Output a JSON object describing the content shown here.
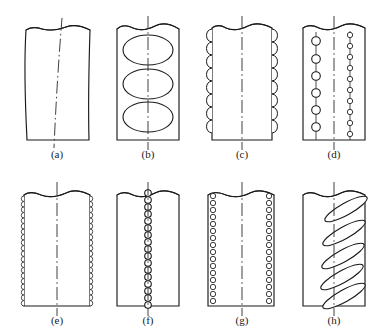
{
  "figure": {
    "type": "technical-line-drawing",
    "panel_count": 8,
    "rows": 2,
    "columns": 4,
    "background_color": "#ffffff",
    "line_color": "#1a1a1a",
    "caption_color": "#1a1a1a"
  },
  "panels": [
    {
      "id": "a",
      "label": "(a)",
      "row": 0,
      "column": 0,
      "box": {
        "x": 24,
        "y": 22,
        "width": 66,
        "height": 118
      },
      "feature_type": "none",
      "feature_count": 0,
      "outline_style": "skewed-curved",
      "centerline": "curved-dash-dot",
      "break_line_top": true,
      "caption_x": 57,
      "caption_y": 158
    },
    {
      "id": "b",
      "label": "(b)",
      "row": 0,
      "column": 1,
      "box": {
        "x": 117,
        "y": 22,
        "width": 62,
        "height": 118
      },
      "feature_type": "large-horizontal-ellipses",
      "feature_count": 3,
      "feature_rx": 24,
      "feature_ry": 15,
      "outline_style": "straight",
      "centerline": "straight-dash-dot",
      "break_line_top": true,
      "caption_x": 148,
      "caption_y": 158
    },
    {
      "id": "c",
      "label": "(c)",
      "row": 0,
      "column": 2,
      "box": {
        "x": 212,
        "y": 22,
        "width": 60,
        "height": 118
      },
      "feature_type": "edge-scallops-coarse",
      "feature_count": 9,
      "scallop_radius": 6.5,
      "outline_style": "straight",
      "centerline": "straight-dash-dot",
      "break_line_top": true,
      "caption_x": 242,
      "caption_y": 158
    },
    {
      "id": "d",
      "label": "(d)",
      "row": 0,
      "column": 3,
      "box": {
        "x": 303,
        "y": 22,
        "width": 62,
        "height": 118
      },
      "feature_type": "two-columns-of-circles",
      "left_column_count": 6,
      "left_column_radius": 4.2,
      "right_column_count": 10,
      "right_column_radius": 2.6,
      "outline_style": "straight",
      "centerline": "straight-dash-dot",
      "break_line_top": true,
      "caption_x": 334,
      "caption_y": 158
    },
    {
      "id": "e",
      "label": "(e)",
      "row": 1,
      "column": 0,
      "box": {
        "x": 24,
        "y": 188,
        "width": 66,
        "height": 118
      },
      "feature_type": "edge-scallops-fine",
      "feature_count": 21,
      "scallop_radius": 2.7,
      "outline_style": "straight",
      "centerline": "straight-dash-dot",
      "break_line_top": true,
      "caption_x": 57,
      "caption_y": 324
    },
    {
      "id": "f",
      "label": "(f)",
      "row": 1,
      "column": 1,
      "box": {
        "x": 117,
        "y": 188,
        "width": 62,
        "height": 118
      },
      "feature_type": "center-column-of-circles",
      "feature_count": 19,
      "feature_radius": 3.2,
      "outline_style": "straight",
      "centerline": "straight-dash-dot",
      "break_line_top": true,
      "caption_x": 148,
      "caption_y": 324
    },
    {
      "id": "g",
      "label": "(g)",
      "row": 1,
      "column": 2,
      "box": {
        "x": 208,
        "y": 188,
        "width": 66,
        "height": 118
      },
      "feature_type": "two-edge-columns-of-circles",
      "left_column_count": 17,
      "right_column_count": 17,
      "feature_radius": 2.6,
      "outline_style": "straight",
      "centerline": "straight-dash-dot",
      "break_line_top": true,
      "caption_x": 242,
      "caption_y": 324
    },
    {
      "id": "h",
      "label": "(h)",
      "row": 1,
      "column": 3,
      "box": {
        "x": 303,
        "y": 188,
        "width": 62,
        "height": 118
      },
      "feature_type": "slanted-elongated-ellipses",
      "feature_count": 5,
      "feature_rx": 24,
      "feature_ry": 6,
      "feature_rotation_deg": -28,
      "outline_style": "straight",
      "centerline": "straight-dash-dot",
      "break_line_top": true,
      "caption_x": 334,
      "caption_y": 324
    }
  ]
}
